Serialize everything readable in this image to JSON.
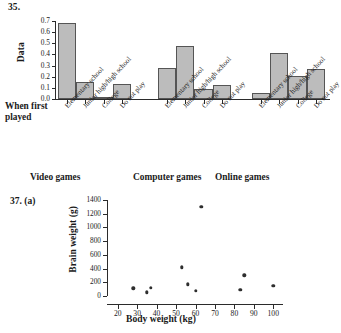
{
  "figures": {
    "bar": {
      "number": "35.",
      "axis_title_x": "When first played",
      "axis_title_y": "Data",
      "group_labels": [
        "Video games",
        "Computer games",
        "Online games"
      ],
      "categories": [
        "Elementary school",
        "Junior high/high school",
        "College",
        "Do not play"
      ],
      "y_ticks": [
        "0.0",
        "0.1",
        "0.2",
        "0.3",
        "0.4",
        "0.5",
        "0.6",
        "0.7"
      ]
    },
    "scatter": {
      "number": "37. (a)",
      "xlabel": "Body weight (kg)",
      "ylabel": "Brain weight (g)",
      "x_ticks": [
        "20",
        "30",
        "40",
        "50",
        "60",
        "70",
        "80",
        "90",
        "100"
      ],
      "y_ticks": [
        "0",
        "200",
        "400",
        "600",
        "800",
        "1000",
        "1200",
        "1400"
      ]
    }
  },
  "chart_data": [
    {
      "type": "bar",
      "title": "35.",
      "xlabel": "When first played",
      "ylabel": "Data",
      "categories": [
        "Elementary school",
        "Junior high/high school",
        "College",
        "Do not play"
      ],
      "groups": [
        "Video games",
        "Computer games",
        "Online games"
      ],
      "series": [
        {
          "name": "Video games",
          "values": [
            0.68,
            0.15,
            0.02,
            0.135
          ]
        },
        {
          "name": "Computer games",
          "values": [
            0.275,
            0.48,
            0.09,
            0.13
          ]
        },
        {
          "name": "Online games",
          "values": [
            0.05,
            0.41,
            0.21,
            0.27
          ]
        }
      ],
      "ylim": [
        0.0,
        0.7
      ],
      "ytick_step": 0.1,
      "grid": false,
      "legend": "none",
      "bar_color": "#bcbcbc",
      "bar_edge_color": "#555555"
    },
    {
      "type": "scatter",
      "title": "37. (a)",
      "xlabel": "Body weight (kg)",
      "ylabel": "Brain weight (g)",
      "xlim": [
        15,
        105
      ],
      "ylim": [
        0,
        1400
      ],
      "xtick_step": 10,
      "ytick_step": 200,
      "grid": false,
      "legend": "none",
      "marker_color": "#2e2e2e",
      "points": [
        {
          "x": 28,
          "y": 115
        },
        {
          "x": 35,
          "y": 55
        },
        {
          "x": 37,
          "y": 120
        },
        {
          "x": 53,
          "y": 420
        },
        {
          "x": 56,
          "y": 170
        },
        {
          "x": 60,
          "y": 75
        },
        {
          "x": 63,
          "y": 1300
        },
        {
          "x": 83,
          "y": 90
        },
        {
          "x": 85,
          "y": 300
        },
        {
          "x": 100,
          "y": 145
        }
      ]
    }
  ]
}
